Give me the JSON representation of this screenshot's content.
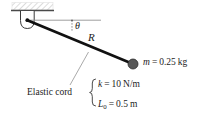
{
  "figure": {
    "type": "physics-free-body-diagram",
    "colors": {
      "rod": "#111111",
      "bob": "#585858",
      "bob_outline": "#2b2b2b",
      "reference_line": "#8c8c8c",
      "leader_line": "#8c8c8c",
      "hatch": "#d8d8d8",
      "ceiling_bar": "#4a4a4a",
      "bracket": "#3a3a3a",
      "text": "#1c1c1c"
    },
    "labels": {
      "angle": "θ",
      "radius": "R",
      "elastic_cord": "Elastic cord"
    },
    "mass": {
      "symbol": "m",
      "equals": "=",
      "value": "0.25",
      "unit": "kg"
    },
    "stiffness": {
      "symbol": "k",
      "equals": "=",
      "value": "10",
      "unit": "N/m"
    },
    "natural_length": {
      "symbol": "L",
      "subscript": "0",
      "equals": "=",
      "value": "0.5",
      "unit": "m"
    },
    "geometry": {
      "pivot_x": 27,
      "pivot_y": 20,
      "bob_x": 133,
      "bob_y": 64,
      "bob_radius": 5,
      "reference_line_end_x": 101,
      "angle_tick_x": 72
    }
  }
}
